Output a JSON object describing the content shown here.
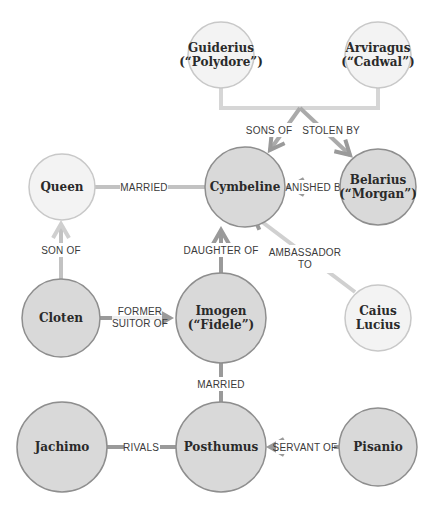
{
  "colors": {
    "background": "#ffffff",
    "node_dark_fill": "#d9d9d9",
    "node_dark_stroke": "#8e8e8e",
    "node_light_fill": "#f3f3f3",
    "node_light_stroke": "#c8c8c8",
    "edge_dark": "#9a9a9a",
    "edge_light": "#cfcfcf",
    "text": "#2a2a2a"
  },
  "nodes": {
    "guiderius": {
      "line1": "Guiderius",
      "line2": "(“Polydore”)",
      "style": "light"
    },
    "arviragus": {
      "line1": "Arviragus",
      "line2": "(“Cadwal”)",
      "style": "light"
    },
    "queen": {
      "line1": "Queen",
      "style": "light"
    },
    "cymbeline": {
      "line1": "Cymbeline",
      "style": "dark"
    },
    "belarius": {
      "line1": "Belarius",
      "line2": "(“Morgan”)",
      "style": "dark"
    },
    "cloten": {
      "line1": "Cloten",
      "style": "dark"
    },
    "imogen": {
      "line1": "Imogen",
      "line2": "(“Fidele”)",
      "style": "dark"
    },
    "caius_lucius": {
      "line1": "Caius",
      "line2": "Lucius",
      "style": "light"
    },
    "jachimo": {
      "line1": "Jachimo",
      "style": "dark"
    },
    "posthumus": {
      "line1": "Posthumus",
      "style": "dark"
    },
    "pisanio": {
      "line1": "Pisanio",
      "style": "dark"
    }
  },
  "edges": {
    "sons_of": {
      "label": "SONS OF",
      "from": "Guiderius & Arviragus",
      "to": "Cymbeline"
    },
    "stolen_by": {
      "label": "STOLEN BY",
      "from": "Guiderius & Arviragus",
      "to": "Belarius"
    },
    "married_queen": {
      "label": "MARRIED",
      "from": "Queen",
      "to": "Cymbeline"
    },
    "banished_by": {
      "label": "BANISHED BY",
      "from": "Belarius",
      "to": "Cymbeline"
    },
    "son_of": {
      "label": "SON OF",
      "from": "Cloten",
      "to": "Queen"
    },
    "daughter_of": {
      "label": "DAUGHTER OF",
      "from": "Imogen",
      "to": "Cymbeline"
    },
    "ambassador_to": {
      "line1": "AMBASSADOR",
      "line2": "TO",
      "from": "Caius Lucius",
      "to": "Cymbeline"
    },
    "former_suitor_of": {
      "line1": "FORMER",
      "line2": "SUITOR OF",
      "from": "Cloten",
      "to": "Imogen"
    },
    "married_imogen": {
      "label": "MARRIED",
      "from": "Imogen",
      "to": "Posthumus"
    },
    "rivals": {
      "label": "RIVALS",
      "from": "Jachimo",
      "to": "Posthumus"
    },
    "servant_of": {
      "label": "SERVANT OF",
      "from": "Pisanio",
      "to": "Posthumus"
    }
  }
}
